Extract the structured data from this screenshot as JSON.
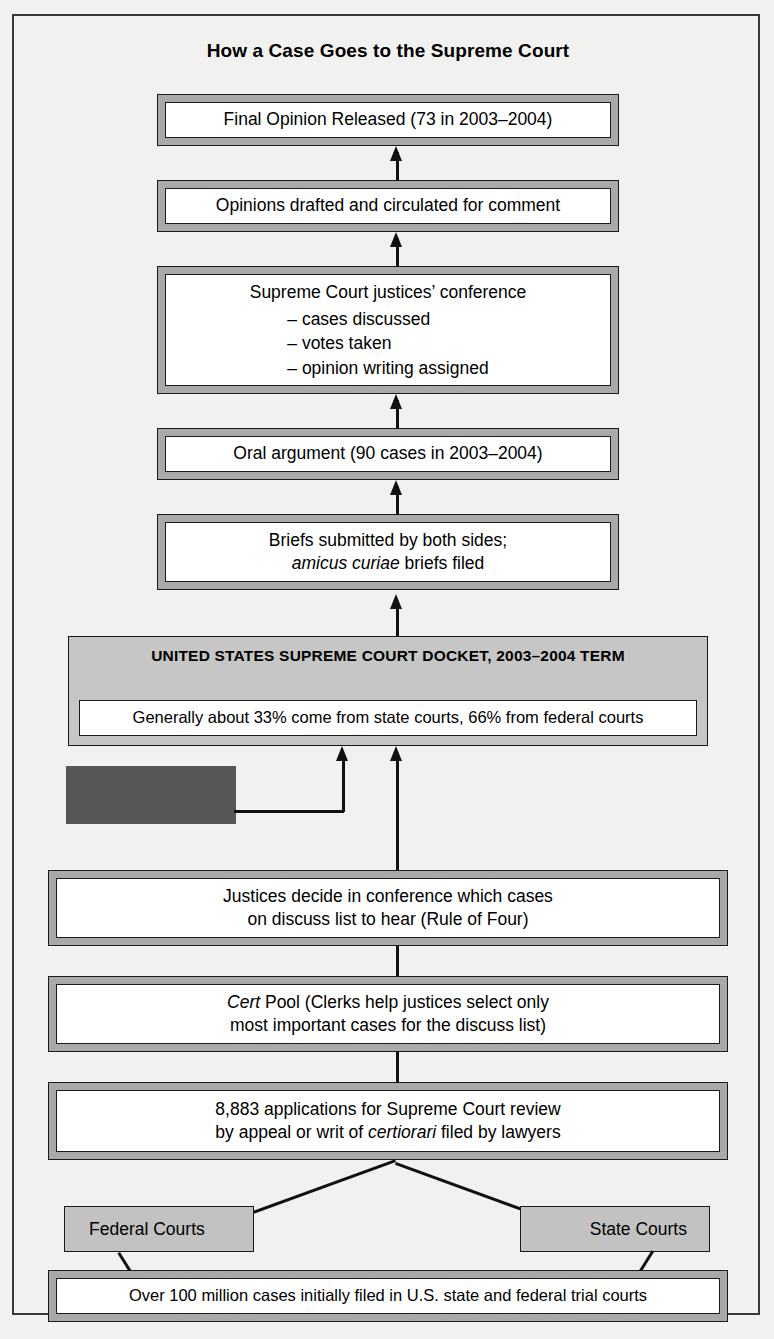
{
  "title": "How a Case Goes to the Supreme Court",
  "steps": {
    "final_opinion": "Final Opinion Released (73 in 2003–2004)",
    "opinions_drafted": "Opinions drafted and circulated for comment",
    "conference_heading": "Supreme Court justices’ conference",
    "conference_items": [
      "– cases discussed",
      "– votes taken",
      "– opinion writing assigned"
    ],
    "oral_argument": "Oral argument (90 cases in 2003–2004)",
    "briefs_line1": "Briefs submitted by both sides;",
    "briefs_italic": "amicus curiae",
    "briefs_line2_tail": " briefs filed",
    "justices_decide_line1": "Justices decide in conference which cases",
    "justices_decide_line2": "on discuss list to hear (Rule of Four)",
    "cert_pool_italic": "Cert",
    "cert_pool_line1_tail": " Pool (Clerks help justices select only",
    "cert_pool_line2": "most important cases for the discuss list)",
    "applications_line1": "8,883 applications for Supreme Court review",
    "applications_line2_head": "by appeal or writ of ",
    "applications_italic": "certiorari",
    "applications_line2_tail": " filed by lawyers",
    "bottom_cases": "Over 100 million cases initially filed in U.S. state and federal trial courts"
  },
  "docket": {
    "heading_line1": "UNITED STATES SUPREME COURT DOCKET,",
    "heading_line2": "2003–2004 TERM",
    "strip": "Generally about 33% come from state courts, 66% from federal courts"
  },
  "courts": {
    "federal": "Federal Courts",
    "state": "State Courts"
  },
  "redacted": {
    "label": ""
  },
  "colors": {
    "page_background": "#f2f2f0",
    "box_band": "#a9a9a9",
    "box_inner": "#ffffff",
    "docket_fill": "#c6c6c6",
    "flat_fill": "#c2c2c2",
    "redacted_fill": "#575757",
    "line": "#111111",
    "border": "#1a1a1a"
  }
}
